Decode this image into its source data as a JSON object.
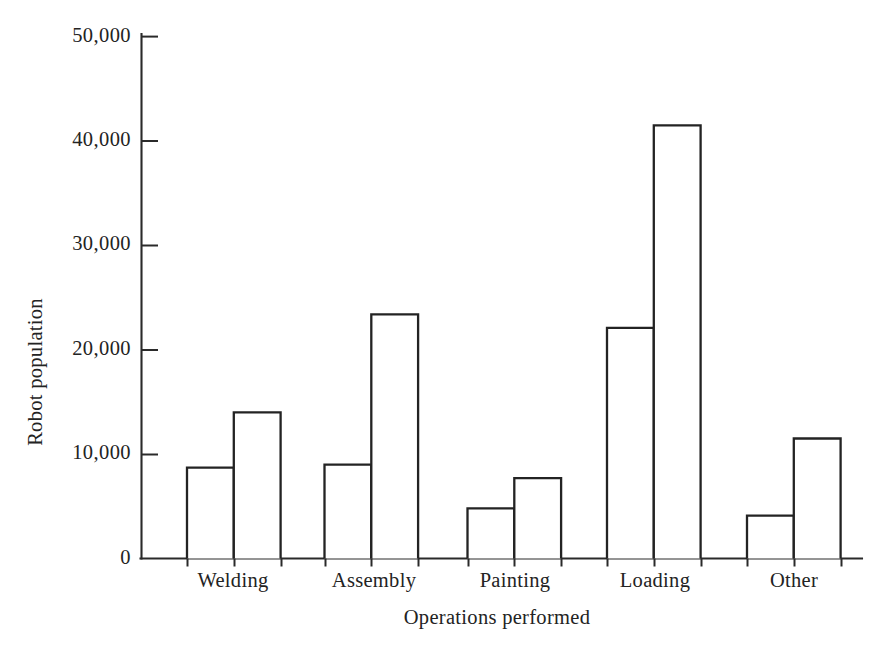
{
  "chart_data": {
    "type": "bar",
    "title": "",
    "subtitle": "",
    "xlabel": "Operations performed",
    "ylabel": "Robot population",
    "categories": [
      "Welding",
      "Assembly",
      "Painting",
      "Loading",
      "Other"
    ],
    "series": [
      {
        "name": "first",
        "values": [
          8700,
          9000,
          4800,
          22100,
          4100
        ]
      },
      {
        "name": "second",
        "values": [
          14000,
          23400,
          7700,
          41500,
          11500
        ]
      }
    ],
    "ylim": [
      0,
      50000
    ],
    "ytick_values": [
      0,
      10000,
      20000,
      30000,
      40000,
      50000
    ],
    "ytick_labels": [
      "0",
      "10,000",
      "20,000",
      "30,000",
      "40,000",
      "50,000"
    ],
    "grid": false,
    "legend": false,
    "legend_position": "none",
    "bar_style": "outline",
    "colors": {
      "bar_stroke": "#232323",
      "bar_fill": "#ffffff",
      "axis": "#2a2a2a",
      "text": "#232323",
      "background": "#ffffff"
    }
  },
  "figure": {
    "caption": ""
  }
}
